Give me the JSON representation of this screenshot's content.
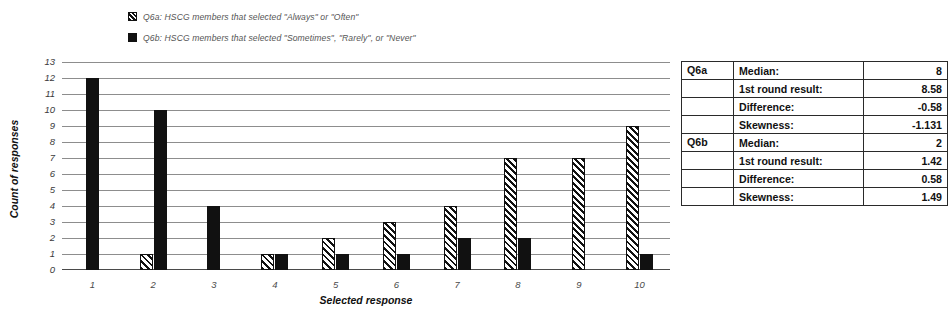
{
  "legend": {
    "items": [
      {
        "marker": "hatch-swatch",
        "label": "Q6a: HSCG members that selected \"Always\" or \"Often\""
      },
      {
        "marker": "solid-swatch",
        "label": "Q6b: HSCG members that selected \"Sometimes\", \"Rarely\", or \"Never\""
      }
    ]
  },
  "chart_data": {
    "type": "bar",
    "title": "",
    "xlabel": "Selected response",
    "ylabel": "Count of responses",
    "categories": [
      "1",
      "2",
      "3",
      "4",
      "5",
      "6",
      "7",
      "8",
      "9",
      "10"
    ],
    "ylim": [
      0,
      13
    ],
    "yticks": [
      "13",
      "12",
      "11",
      "10",
      "9",
      "8",
      "7",
      "6",
      "5",
      "4",
      "3",
      "2",
      "1",
      "0"
    ],
    "grid": true,
    "legend_position": "top-left",
    "series": [
      {
        "name": "Q6a: HSCG members that selected \"Always\" or \"Often\"",
        "pattern": "diagonal-hatch",
        "color": "#111111",
        "values": [
          0,
          1,
          0,
          1,
          2,
          3,
          4,
          7,
          7,
          9
        ]
      },
      {
        "name": "Q6b: HSCG members that selected \"Sometimes\", \"Rarely\", or \"Never\"",
        "pattern": "solid",
        "color": "#111111",
        "values": [
          12,
          10,
          4,
          1,
          1,
          1,
          2,
          2,
          0,
          1
        ]
      }
    ]
  },
  "stats_table": {
    "rows": [
      {
        "group": "Q6a",
        "metric": "Median:",
        "value": "8"
      },
      {
        "group": "",
        "metric": "1st round result:",
        "value": "8.58"
      },
      {
        "group": "",
        "metric": "Difference:",
        "value": "-0.58"
      },
      {
        "group": "",
        "metric": "Skewness:",
        "value": "-1.131"
      },
      {
        "group": "Q6b",
        "metric": "Median:",
        "value": "2"
      },
      {
        "group": "",
        "metric": "1st round result:",
        "value": "1.42"
      },
      {
        "group": "",
        "metric": "Difference:",
        "value": "0.58"
      },
      {
        "group": "",
        "metric": "Skewness:",
        "value": "1.49"
      }
    ]
  }
}
